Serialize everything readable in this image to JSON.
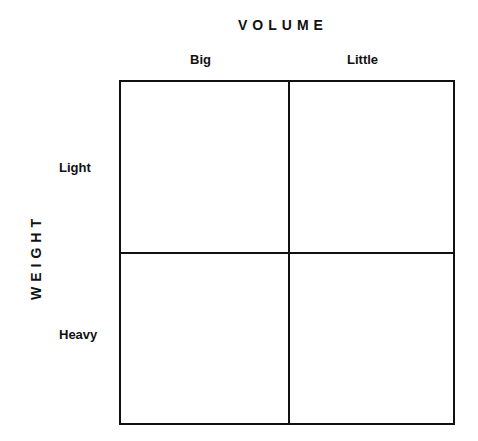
{
  "diagram": {
    "x_axis_title": "VOLUME",
    "y_axis_title": "WEIGHT",
    "columns": [
      {
        "label": "Big"
      },
      {
        "label": "Little"
      }
    ],
    "rows": [
      {
        "label": "Light"
      },
      {
        "label": "Heavy"
      }
    ],
    "cells": [
      {
        "row": "Light",
        "column": "Big",
        "content": ""
      },
      {
        "row": "Light",
        "column": "Little",
        "content": ""
      },
      {
        "row": "Heavy",
        "column": "Big",
        "content": ""
      },
      {
        "row": "Heavy",
        "column": "Little",
        "content": ""
      }
    ]
  }
}
